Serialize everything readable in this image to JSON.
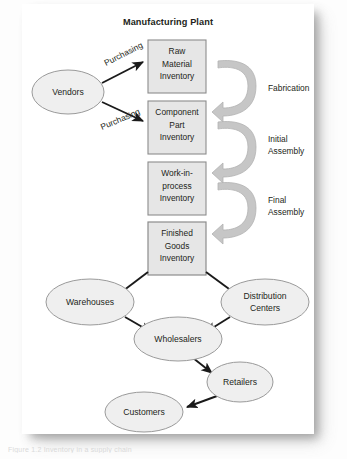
{
  "diagram": {
    "title": "Manufacturing Plant",
    "caption": "Figure 1.2 Inventory in a supply chain",
    "colors": {
      "page": "#ffffff",
      "box_fill": "#e6e6e6",
      "box_stroke": "#8c8c8c",
      "ellipse_fill": "#efefef",
      "ellipse_stroke": "#9a9a9a",
      "arrow": "#1a1a1a",
      "curved_arrow": "#c6c6c6",
      "curved_arrow_stroke": "#b0b0b0",
      "text": "#231f20"
    },
    "boxes": [
      {
        "id": "raw-material-inventory",
        "lines": [
          "Raw",
          "Material",
          "Inventory"
        ]
      },
      {
        "id": "component-part-inventory",
        "lines": [
          "Component",
          "Part",
          "Inventory"
        ]
      },
      {
        "id": "work-in-process-inventory",
        "lines": [
          "Work-in-",
          "process",
          "Inventory"
        ]
      },
      {
        "id": "finished-goods-inventory",
        "lines": [
          "Finished",
          "Goods",
          "Inventory"
        ]
      }
    ],
    "ellipses": [
      {
        "id": "vendors",
        "label": "Vendors"
      },
      {
        "id": "warehouses",
        "label": "Warehouses"
      },
      {
        "id": "distribution-centers",
        "lines": [
          "Distribution",
          "Centers"
        ]
      },
      {
        "id": "wholesalers",
        "label": "Wholesalers"
      },
      {
        "id": "retailers",
        "label": "Retailers"
      },
      {
        "id": "customers",
        "label": "Customers"
      }
    ],
    "edge_labels": [
      {
        "id": "purchasing-top",
        "label": "Purchasing"
      },
      {
        "id": "purchasing-bottom",
        "label": "Purchasing"
      }
    ],
    "process_labels": [
      {
        "id": "fabrication",
        "lines": [
          "Fabrication"
        ]
      },
      {
        "id": "initial-assembly",
        "lines": [
          "Initial",
          "Assembly"
        ]
      },
      {
        "id": "final-assembly",
        "lines": [
          "Final",
          "Assembly"
        ]
      }
    ]
  }
}
